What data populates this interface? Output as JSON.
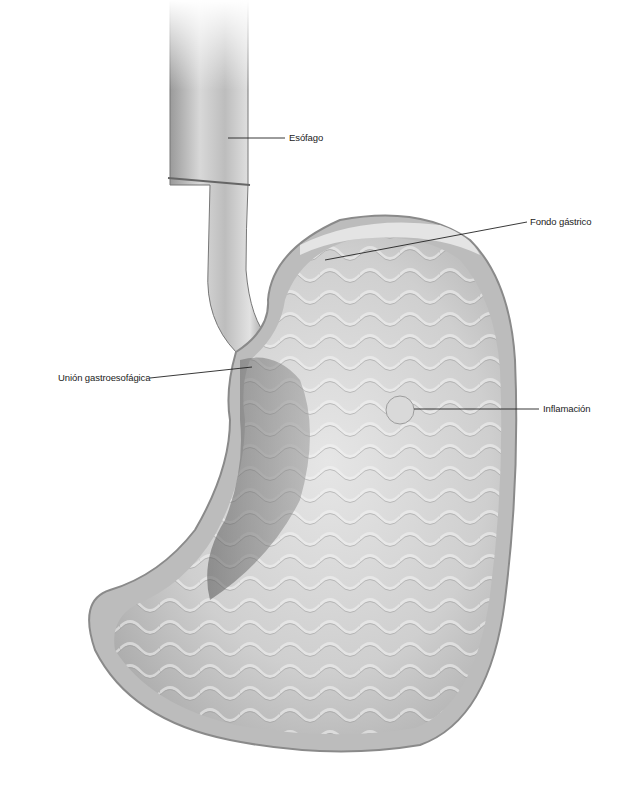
{
  "diagram": {
    "labels": [
      {
        "id": "esofago",
        "text": "Esófago"
      },
      {
        "id": "fondo",
        "text": "Fondo gástrico"
      },
      {
        "id": "union",
        "text": "Unión gastroesofágica"
      },
      {
        "id": "inflamacion",
        "text": "Inflamación"
      }
    ]
  }
}
